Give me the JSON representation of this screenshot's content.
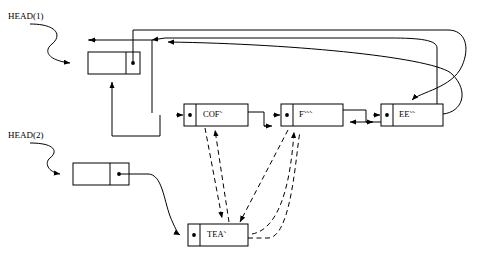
{
  "diagram": {
    "colors": {
      "stroke": "#000000",
      "background": "#ffffff",
      "text": "#000000"
    },
    "heads": [
      {
        "name": "head-1",
        "label": "HEAD(1)",
        "x": 8,
        "y": 12
      },
      {
        "name": "head-2",
        "label": "HEAD(2)",
        "x": 8,
        "y": 131
      }
    ],
    "nodes": [
      {
        "name": "node-list1-first",
        "label": "",
        "x": 88,
        "y": 52,
        "w": 52,
        "h": 22
      },
      {
        "name": "node-cof",
        "label": "COF˜",
        "x": 184,
        "y": 104,
        "w": 64,
        "h": 22
      },
      {
        "name": "node-f",
        "label": "F˜˜˜",
        "x": 281,
        "y": 104,
        "w": 62,
        "h": 22
      },
      {
        "name": "node-ee",
        "label": "EE˜˜",
        "x": 381,
        "y": 104,
        "w": 62,
        "h": 22
      },
      {
        "name": "node-list2-first",
        "label": "",
        "x": 73,
        "y": 163,
        "w": 56,
        "h": 22
      },
      {
        "name": "node-tea",
        "label": "TEA˜",
        "x": 188,
        "y": 224,
        "w": 60,
        "h": 22
      }
    ],
    "solid_edge_count": 12,
    "dashed_edge_count": 5,
    "legend_note": ""
  }
}
